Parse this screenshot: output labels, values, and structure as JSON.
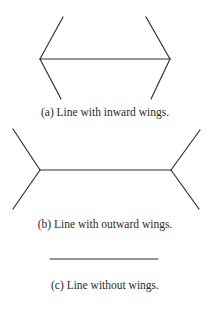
{
  "figures": [
    {
      "id": "a",
      "caption": "(a) Line with inward wings.",
      "shaft": {
        "x1": 40,
        "y1": 59,
        "x2": 170,
        "y2": 59
      },
      "wings": [
        {
          "x1": 40,
          "y1": 59,
          "x2": 63,
          "y2": 17
        },
        {
          "x1": 40,
          "y1": 59,
          "x2": 61,
          "y2": 99
        },
        {
          "x1": 170,
          "y1": 59,
          "x2": 146,
          "y2": 17
        },
        {
          "x1": 170,
          "y1": 59,
          "x2": 151,
          "y2": 99
        }
      ]
    },
    {
      "id": "b",
      "caption": "(b) Line with outward wings.",
      "shaft": {
        "x1": 40,
        "y1": 170,
        "x2": 171,
        "y2": 170
      },
      "wings": [
        {
          "x1": 40,
          "y1": 170,
          "x2": 13,
          "y2": 129
        },
        {
          "x1": 40,
          "y1": 170,
          "x2": 13,
          "y2": 209
        },
        {
          "x1": 171,
          "y1": 170,
          "x2": 200,
          "y2": 130
        },
        {
          "x1": 171,
          "y1": 170,
          "x2": 199,
          "y2": 209
        }
      ]
    },
    {
      "id": "c",
      "caption": "(c) Line without wings.",
      "shaft": {
        "x1": 50,
        "y1": 259,
        "x2": 158,
        "y2": 259
      },
      "wings": []
    }
  ],
  "stroke_color": "#333333"
}
